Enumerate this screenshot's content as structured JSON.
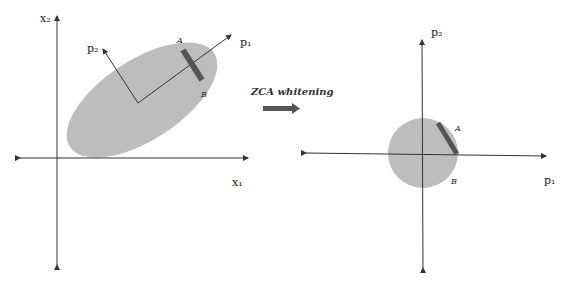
{
  "left_panel": {
    "axis_x_label": "x₁",
    "axis_y_label": "x₂",
    "pc1_label": "p₁",
    "pc2_label": "p₂",
    "point_a_label": "A",
    "point_b_label": "B"
  },
  "transform": {
    "label": "ZCA whitening",
    "arrow_icon": "right-arrow-icon"
  },
  "right_panel": {
    "axis_x_label": "p₁",
    "axis_y_label": "p₂",
    "point_a_label": "A",
    "point_b_label": "B"
  },
  "colors": {
    "ellipse_fill": "#bdbdbd",
    "bar_fill": "#555555",
    "axis": "#333333"
  }
}
